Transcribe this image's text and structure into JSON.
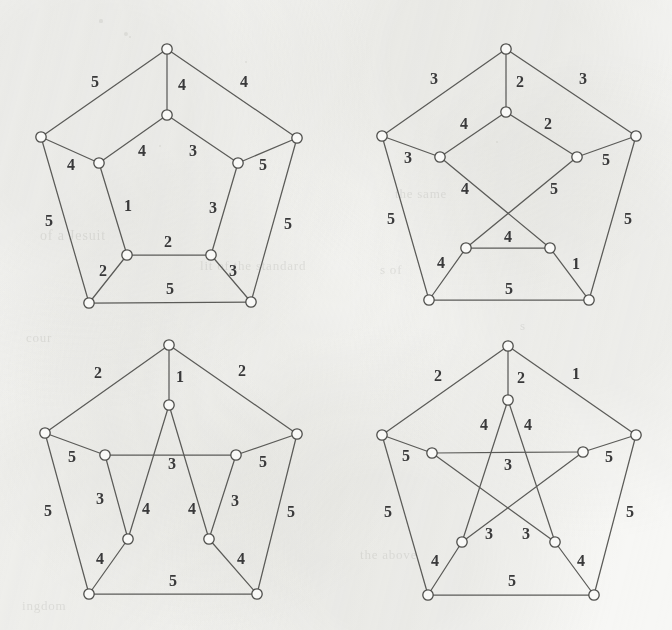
{
  "figure": {
    "background_color": "#f7f7f5",
    "ink_color": "#4e4e4b",
    "label_color": "#39393a",
    "node_fill": "#f9f9f7",
    "panel_count": 4
  },
  "ghost_text": [
    {
      "text": "the same",
      "x": 395,
      "y": 186,
      "size": 13
    },
    {
      "text": "of   a   Jesuit",
      "x": 40,
      "y": 228,
      "size": 14
    },
    {
      "text": "lit   of   the   standard",
      "x": 200,
      "y": 258,
      "size": 13
    },
    {
      "text": "cour",
      "x": 26,
      "y": 330,
      "size": 13
    },
    {
      "text": "s of",
      "x": 380,
      "y": 262,
      "size": 13
    },
    {
      "text": "ingdom",
      "x": 22,
      "y": 598,
      "size": 13
    },
    {
      "text": "the   above",
      "x": 360,
      "y": 547,
      "size": 13
    },
    {
      "text": "s",
      "x": 520,
      "y": 318,
      "size": 13
    }
  ],
  "specks": [
    {
      "x": 101,
      "y": 21,
      "r": 1.6
    },
    {
      "x": 126,
      "y": 34,
      "r": 2.2
    },
    {
      "x": 130,
      "y": 37,
      "r": 1.4
    },
    {
      "x": 246,
      "y": 62,
      "r": 1.2
    },
    {
      "x": 160,
      "y": 146,
      "r": 1.1
    },
    {
      "x": 497,
      "y": 142,
      "r": 1.3
    }
  ],
  "graphs": [
    {
      "id": "graph-top-left",
      "name": "graph-1",
      "viewbox": "0 0 336 320",
      "position": {
        "left": 0,
        "top": 0,
        "width": 336,
        "height": 320
      },
      "nodes": [
        {
          "id": "O0",
          "x": 167,
          "y": 49
        },
        {
          "id": "O1",
          "x": 297,
          "y": 138
        },
        {
          "id": "O2",
          "x": 251,
          "y": 302
        },
        {
          "id": "O3",
          "x": 89,
          "y": 303
        },
        {
          "id": "O4",
          "x": 41,
          "y": 137
        },
        {
          "id": "I0",
          "x": 167,
          "y": 115
        },
        {
          "id": "I1",
          "x": 238,
          "y": 163
        },
        {
          "id": "I2",
          "x": 211,
          "y": 255
        },
        {
          "id": "I3",
          "x": 127,
          "y": 255
        },
        {
          "id": "I4",
          "x": 99,
          "y": 163
        }
      ],
      "edges": [
        {
          "from": "O0",
          "to": "O4",
          "label": "5",
          "lx": 95,
          "ly": 83
        },
        {
          "from": "O0",
          "to": "O1",
          "label": "4",
          "lx": 244,
          "ly": 83
        },
        {
          "from": "O1",
          "to": "O2",
          "label": "5",
          "lx": 288,
          "ly": 225
        },
        {
          "from": "O2",
          "to": "O3",
          "label": "5",
          "lx": 170,
          "ly": 290
        },
        {
          "from": "O3",
          "to": "O4",
          "label": "5",
          "lx": 49,
          "ly": 222
        },
        {
          "from": "O0",
          "to": "I0",
          "label": "4",
          "lx": 182,
          "ly": 86
        },
        {
          "from": "O1",
          "to": "I1",
          "label": "5",
          "lx": 263,
          "ly": 166
        },
        {
          "from": "O2",
          "to": "I2",
          "label": "3",
          "lx": 233,
          "ly": 272
        },
        {
          "from": "O3",
          "to": "I3",
          "label": "2",
          "lx": 103,
          "ly": 272
        },
        {
          "from": "O4",
          "to": "I4",
          "label": "4",
          "lx": 71,
          "ly": 166
        },
        {
          "from": "I0",
          "to": "I4",
          "label": "4",
          "lx": 142,
          "ly": 152
        },
        {
          "from": "I0",
          "to": "I1",
          "label": "3",
          "lx": 193,
          "ly": 152
        },
        {
          "from": "I1",
          "to": "I2",
          "label": "3",
          "lx": 213,
          "ly": 209
        },
        {
          "from": "I2",
          "to": "I3",
          "label": "2",
          "lx": 168,
          "ly": 243
        },
        {
          "from": "I3",
          "to": "I4",
          "label": "1",
          "lx": 128,
          "ly": 207
        }
      ]
    },
    {
      "id": "graph-top-right",
      "name": "graph-2",
      "viewbox": "0 0 336 320",
      "position": {
        "left": 336,
        "top": 0,
        "width": 336,
        "height": 320
      },
      "nodes": [
        {
          "id": "O0",
          "x": 170,
          "y": 49
        },
        {
          "id": "O1",
          "x": 300,
          "y": 136
        },
        {
          "id": "O2",
          "x": 253,
          "y": 300
        },
        {
          "id": "O3",
          "x": 93,
          "y": 300
        },
        {
          "id": "O4",
          "x": 46,
          "y": 136
        },
        {
          "id": "I0",
          "x": 170,
          "y": 112
        },
        {
          "id": "I1",
          "x": 241,
          "y": 157
        },
        {
          "id": "I2",
          "x": 214,
          "y": 248
        },
        {
          "id": "I3",
          "x": 130,
          "y": 248
        },
        {
          "id": "I4",
          "x": 104,
          "y": 157
        }
      ],
      "edges": [
        {
          "from": "O0",
          "to": "O4",
          "label": "3",
          "lx": 98,
          "ly": 80
        },
        {
          "from": "O0",
          "to": "O1",
          "label": "3",
          "lx": 247,
          "ly": 80
        },
        {
          "from": "O1",
          "to": "O2",
          "label": "5",
          "lx": 292,
          "ly": 220
        },
        {
          "from": "O2",
          "to": "O3",
          "label": "5",
          "lx": 173,
          "ly": 290
        },
        {
          "from": "O3",
          "to": "O4",
          "label": "5",
          "lx": 55,
          "ly": 220
        },
        {
          "from": "O0",
          "to": "I0",
          "label": "2",
          "lx": 184,
          "ly": 83
        },
        {
          "from": "O1",
          "to": "I1",
          "label": "5",
          "lx": 270,
          "ly": 161
        },
        {
          "from": "O2",
          "to": "I2",
          "label": "1",
          "lx": 240,
          "ly": 265
        },
        {
          "from": "O3",
          "to": "I3",
          "label": "4",
          "lx": 105,
          "ly": 264
        },
        {
          "from": "O4",
          "to": "I4",
          "label": "3",
          "lx": 72,
          "ly": 159
        },
        {
          "from": "I0",
          "to": "I4",
          "label": "4",
          "lx": 128,
          "ly": 125
        },
        {
          "from": "I0",
          "to": "I1",
          "label": "2",
          "lx": 212,
          "ly": 125
        },
        {
          "from": "I1",
          "to": "I3",
          "label": "5",
          "lx": 218,
          "ly": 190
        },
        {
          "from": "I2",
          "to": "I3",
          "label": "4",
          "lx": 172,
          "ly": 238
        },
        {
          "from": "I4",
          "to": "I2",
          "label": "4",
          "lx": 129,
          "ly": 190
        }
      ]
    },
    {
      "id": "graph-bottom-left",
      "name": "graph-3",
      "viewbox": "0 0 336 320",
      "position": {
        "left": 0,
        "top": 310,
        "width": 336,
        "height": 320
      },
      "nodes": [
        {
          "id": "O0",
          "x": 169,
          "y": 35
        },
        {
          "id": "O1",
          "x": 297,
          "y": 124
        },
        {
          "id": "O2",
          "x": 257,
          "y": 284
        },
        {
          "id": "O3",
          "x": 89,
          "y": 284
        },
        {
          "id": "O4",
          "x": 45,
          "y": 123
        },
        {
          "id": "I0",
          "x": 169,
          "y": 95
        },
        {
          "id": "I1",
          "x": 236,
          "y": 145
        },
        {
          "id": "I2",
          "x": 209,
          "y": 229
        },
        {
          "id": "I3",
          "x": 128,
          "y": 229
        },
        {
          "id": "I4",
          "x": 105,
          "y": 145
        }
      ],
      "edges": [
        {
          "from": "O0",
          "to": "O4",
          "label": "2",
          "lx": 98,
          "ly": 64
        },
        {
          "from": "O0",
          "to": "O1",
          "label": "2",
          "lx": 242,
          "ly": 62
        },
        {
          "from": "O1",
          "to": "O2",
          "label": "5",
          "lx": 291,
          "ly": 203
        },
        {
          "from": "O2",
          "to": "O3",
          "label": "5",
          "lx": 173,
          "ly": 272
        },
        {
          "from": "O3",
          "to": "O4",
          "label": "5",
          "lx": 48,
          "ly": 202
        },
        {
          "from": "O0",
          "to": "I0",
          "label": "1",
          "lx": 180,
          "ly": 68
        },
        {
          "from": "O1",
          "to": "I1",
          "label": "5",
          "lx": 263,
          "ly": 153
        },
        {
          "from": "O2",
          "to": "I2",
          "label": "4",
          "lx": 241,
          "ly": 250
        },
        {
          "from": "O3",
          "to": "I3",
          "label": "4",
          "lx": 100,
          "ly": 250
        },
        {
          "from": "O4",
          "to": "I4",
          "label": "5",
          "lx": 72,
          "ly": 148
        },
        {
          "from": "I4",
          "to": "I1",
          "label": "3",
          "lx": 172,
          "ly": 155
        },
        {
          "from": "I0",
          "to": "I2",
          "label": "4",
          "lx": 192,
          "ly": 200
        },
        {
          "from": "I0",
          "to": "I3",
          "label": "4",
          "lx": 146,
          "ly": 200
        },
        {
          "from": "I1",
          "to": "I2",
          "label": "3",
          "lx": 235,
          "ly": 192
        },
        {
          "from": "I4",
          "to": "I3",
          "label": "3",
          "lx": 100,
          "ly": 190
        }
      ]
    },
    {
      "id": "graph-bottom-right",
      "name": "graph-4",
      "viewbox": "0 0 336 320",
      "position": {
        "left": 336,
        "top": 310,
        "width": 336,
        "height": 320
      },
      "nodes": [
        {
          "id": "O0",
          "x": 172,
          "y": 36
        },
        {
          "id": "O1",
          "x": 300,
          "y": 125
        },
        {
          "id": "O2",
          "x": 258,
          "y": 285
        },
        {
          "id": "O3",
          "x": 92,
          "y": 285
        },
        {
          "id": "O4",
          "x": 46,
          "y": 125
        },
        {
          "id": "I0",
          "x": 172,
          "y": 90
        },
        {
          "id": "I1",
          "x": 247,
          "y": 142
        },
        {
          "id": "I2",
          "x": 219,
          "y": 232
        },
        {
          "id": "I3",
          "x": 126,
          "y": 232
        },
        {
          "id": "I4",
          "x": 96,
          "y": 143
        }
      ],
      "edges": [
        {
          "from": "O0",
          "to": "O4",
          "label": "2",
          "lx": 102,
          "ly": 67
        },
        {
          "from": "O0",
          "to": "O1",
          "label": "1",
          "lx": 240,
          "ly": 65
        },
        {
          "from": "O1",
          "to": "O2",
          "label": "5",
          "lx": 294,
          "ly": 203
        },
        {
          "from": "O2",
          "to": "O3",
          "label": "5",
          "lx": 176,
          "ly": 272
        },
        {
          "from": "O3",
          "to": "O4",
          "label": "5",
          "lx": 52,
          "ly": 203
        },
        {
          "from": "O0",
          "to": "I0",
          "label": "2",
          "lx": 185,
          "ly": 69
        },
        {
          "from": "O1",
          "to": "I1",
          "label": "5",
          "lx": 273,
          "ly": 148
        },
        {
          "from": "O2",
          "to": "I2",
          "label": "4",
          "lx": 245,
          "ly": 252
        },
        {
          "from": "O3",
          "to": "I3",
          "label": "4",
          "lx": 99,
          "ly": 252
        },
        {
          "from": "O4",
          "to": "I4",
          "label": "5",
          "lx": 70,
          "ly": 147
        },
        {
          "from": "I0",
          "to": "I2",
          "label": "4",
          "lx": 192,
          "ly": 116
        },
        {
          "from": "I0",
          "to": "I3",
          "label": "4",
          "lx": 148,
          "ly": 116
        },
        {
          "from": "I1",
          "to": "I3",
          "label": "3",
          "lx": 190,
          "ly": 225
        },
        {
          "from": "I2",
          "to": "I4",
          "label": "3",
          "lx": 153,
          "ly": 225
        },
        {
          "from": "I4",
          "to": "I1",
          "label": "3",
          "lx": 172,
          "ly": 156
        }
      ]
    }
  ]
}
